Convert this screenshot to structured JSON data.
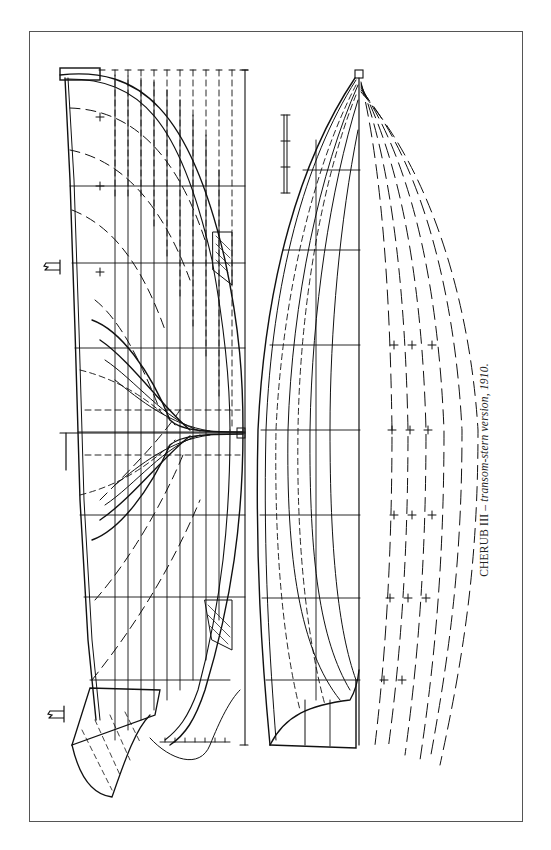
{
  "figure": {
    "caption": {
      "title": "CHERUB III",
      "separator": " – ",
      "description": "transom-stern version, 1910."
    },
    "drawing_type": "lines plan",
    "views": [
      "profile / sheer plan with body plan",
      "half-breadth plan"
    ],
    "colors": {
      "ink": "#111111",
      "frame": "#555555",
      "paper": "#ffffff"
    }
  }
}
